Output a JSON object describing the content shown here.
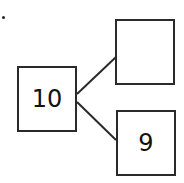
{
  "diagram": {
    "type": "number-bond",
    "whole": {
      "value": "10"
    },
    "parts": [
      {
        "value": ""
      },
      {
        "value": "9"
      }
    ]
  }
}
